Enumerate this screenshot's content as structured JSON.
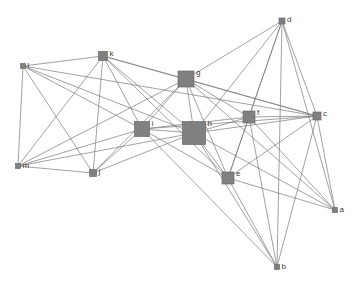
{
  "figure": {
    "type": "network-graph",
    "title": "",
    "background_color": "#ffffff",
    "node_color": "#808080",
    "node_stroke_color": "#6b6b6b",
    "edge_color": "#7a7a7a",
    "label_color": "#3b3b3b",
    "edge_width": 0.7,
    "width": 357,
    "height": 286
  },
  "chart_data": {
    "type": "scatter",
    "title": "",
    "xlabel": "",
    "ylabel": "",
    "graph_kind": "undirected-node-link-diagram",
    "node_size_encodes": "degree",
    "nodes": [
      {
        "id": "a",
        "label": "a",
        "x": 335,
        "y": 210,
        "size": 5,
        "degree": 6
      },
      {
        "id": "b",
        "label": "b",
        "x": 277,
        "y": 267,
        "size": 5,
        "degree": 6
      },
      {
        "id": "c",
        "label": "c",
        "x": 317,
        "y": 116,
        "size": 8,
        "degree": 9
      },
      {
        "id": "d",
        "label": "d",
        "x": 282,
        "y": 21,
        "size": 6,
        "degree": 6
      },
      {
        "id": "e",
        "label": "e",
        "x": 228,
        "y": 178,
        "size": 12,
        "degree": 9
      },
      {
        "id": "f",
        "label": "f",
        "x": 249,
        "y": 117,
        "size": 12,
        "degree": 10
      },
      {
        "id": "g",
        "label": "g",
        "x": 186,
        "y": 79,
        "size": 16,
        "degree": 11
      },
      {
        "id": "h",
        "label": "h",
        "x": 194,
        "y": 133,
        "size": 23,
        "degree": 14
      },
      {
        "id": "i",
        "label": "i",
        "x": 142,
        "y": 129,
        "size": 15,
        "degree": 12
      },
      {
        "id": "j",
        "label": "j",
        "x": 93,
        "y": 173,
        "size": 7,
        "degree": 7
      },
      {
        "id": "k",
        "label": "k",
        "x": 103,
        "y": 56,
        "size": 9,
        "degree": 9
      },
      {
        "id": "l",
        "label": "l",
        "x": 23,
        "y": 66,
        "size": 5,
        "degree": 6
      },
      {
        "id": "m",
        "label": "m",
        "x": 18,
        "y": 166,
        "size": 5,
        "degree": 6
      }
    ],
    "edges": [
      [
        "l",
        "k"
      ],
      [
        "l",
        "m"
      ],
      [
        "l",
        "j"
      ],
      [
        "l",
        "i"
      ],
      [
        "l",
        "h"
      ],
      [
        "l",
        "c"
      ],
      [
        "m",
        "k"
      ],
      [
        "m",
        "j"
      ],
      [
        "m",
        "i"
      ],
      [
        "m",
        "h"
      ],
      [
        "m",
        "g"
      ],
      [
        "k",
        "j"
      ],
      [
        "k",
        "i"
      ],
      [
        "k",
        "h"
      ],
      [
        "k",
        "g"
      ],
      [
        "k",
        "e"
      ],
      [
        "k",
        "c"
      ],
      [
        "j",
        "i"
      ],
      [
        "j",
        "h"
      ],
      [
        "j",
        "g"
      ],
      [
        "i",
        "h"
      ],
      [
        "i",
        "g"
      ],
      [
        "i",
        "f"
      ],
      [
        "i",
        "e"
      ],
      [
        "i",
        "c"
      ],
      [
        "i",
        "b"
      ],
      [
        "h",
        "g"
      ],
      [
        "h",
        "f"
      ],
      [
        "h",
        "e"
      ],
      [
        "h",
        "c"
      ],
      [
        "h",
        "d"
      ],
      [
        "h",
        "b"
      ],
      [
        "h",
        "a"
      ],
      [
        "g",
        "f"
      ],
      [
        "g",
        "e"
      ],
      [
        "g",
        "c"
      ],
      [
        "g",
        "d"
      ],
      [
        "g",
        "a"
      ],
      [
        "f",
        "e"
      ],
      [
        "f",
        "c"
      ],
      [
        "f",
        "d"
      ],
      [
        "f",
        "b"
      ],
      [
        "f",
        "a"
      ],
      [
        "e",
        "c"
      ],
      [
        "e",
        "d"
      ],
      [
        "e",
        "b"
      ],
      [
        "e",
        "a"
      ],
      [
        "c",
        "d"
      ],
      [
        "c",
        "b"
      ],
      [
        "c",
        "a"
      ],
      [
        "d",
        "b"
      ],
      [
        "d",
        "a"
      ]
    ],
    "legend": [],
    "grid": false
  }
}
